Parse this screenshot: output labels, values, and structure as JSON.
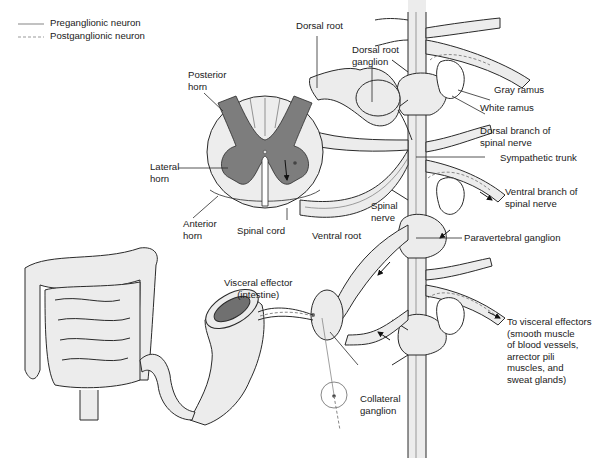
{
  "legend": {
    "items": [
      {
        "label": "Preganglionic neuron",
        "style": "solid"
      },
      {
        "label": "Postganglionic neuron",
        "style": "dashed"
      }
    ]
  },
  "labels": {
    "dorsal_root": "Dorsal root",
    "dorsal_root_ganglion": [
      "Dorsal root",
      "ganglion"
    ],
    "posterior_horn": [
      "Posterior",
      "horn"
    ],
    "lateral_horn": [
      "Lateral",
      "horn"
    ],
    "anterior_horn": [
      "Anterior",
      "horn"
    ],
    "spinal_cord": "Spinal cord",
    "ventral_root": "Ventral root",
    "spinal_nerve": [
      "Spinal",
      "nerve"
    ],
    "gray_ramus": "Gray ramus",
    "white_ramus": "White ramus",
    "dorsal_branch": [
      "Dorsal branch of",
      "spinal nerve"
    ],
    "sympathetic_trunk": "Sympathetic trunk",
    "ventral_branch": [
      "Ventral branch of",
      "spinal nerve"
    ],
    "paravertebral_ganglion": "Paravertebral ganglion",
    "visceral_effector": [
      "Visceral effector",
      "(intestine)"
    ],
    "collateral_ganglion": [
      "Collateral",
      "ganglion"
    ],
    "to_visceral_effectors": [
      "To visceral effectors",
      "(smooth muscle",
      "of blood vessels,",
      "arrector pili",
      "muscles, and",
      "sweat glands)"
    ]
  },
  "colors": {
    "gray_matter": "#7d7d7d",
    "white_matter": "#ededed",
    "nerve_fill": "#ececec",
    "outline": "#2a2a2a",
    "intestine_lumen": "#707070"
  }
}
